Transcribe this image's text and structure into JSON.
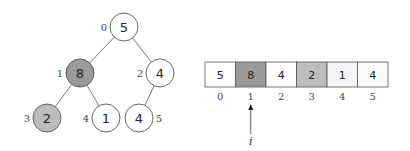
{
  "tree": {
    "nodes": [
      {
        "index": "0",
        "value": "5",
        "cx": 124,
        "cy": 27,
        "fill": "#ffffff",
        "label_side": "left"
      },
      {
        "index": "1",
        "value": "8",
        "cx": 80,
        "cy": 73,
        "fill": "#9a9a9a",
        "label_side": "left"
      },
      {
        "index": "2",
        "value": "4",
        "cx": 160,
        "cy": 73,
        "fill": "#ffffff",
        "label_side": "left"
      },
      {
        "index": "3",
        "value": "2",
        "cx": 47,
        "cy": 118,
        "fill": "#bdbdbd",
        "label_side": "left"
      },
      {
        "index": "4",
        "value": "1",
        "cx": 106,
        "cy": 118,
        "fill": "#ffffff",
        "label_side": "left"
      },
      {
        "index": "5",
        "value": "4",
        "cx": 139,
        "cy": 118,
        "fill": "#ffffff",
        "label_side": "right"
      }
    ],
    "edges": [
      [
        0,
        1
      ],
      [
        0,
        2
      ],
      [
        1,
        3
      ],
      [
        1,
        4
      ],
      [
        2,
        5
      ]
    ]
  },
  "array": {
    "cells": [
      {
        "index": "0",
        "value": "5",
        "fill": "#ffffff"
      },
      {
        "index": "1",
        "value": "8",
        "fill": "#9a9a9a"
      },
      {
        "index": "2",
        "value": "4",
        "fill": "#ffffff"
      },
      {
        "index": "3",
        "value": "2",
        "fill": "#bdbdbd"
      },
      {
        "index": "4",
        "value": "1",
        "fill": "#f4f4f4"
      },
      {
        "index": "5",
        "value": "4",
        "fill": "#fafafa"
      }
    ],
    "pointer": {
      "label": "i",
      "target_index": 1
    }
  },
  "colors": {
    "stroke": "#555555",
    "edge": "#555555"
  }
}
